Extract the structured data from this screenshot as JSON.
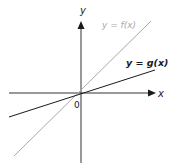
{
  "diagram": {
    "type": "coordinate-axes-with-two-lines",
    "axes": {
      "x_label": "x",
      "y_label": "y",
      "origin_label": "0"
    },
    "lines": [
      {
        "name": "f",
        "label": "y = f(x)",
        "color": "#a8a8a8",
        "description": "steeper line through origin"
      },
      {
        "name": "g",
        "label": "y = g(x)",
        "color": "#1a1a1a",
        "description": "shallower line through origin"
      }
    ],
    "colors": {
      "axis": "#333333",
      "background": "#ffffff"
    }
  }
}
